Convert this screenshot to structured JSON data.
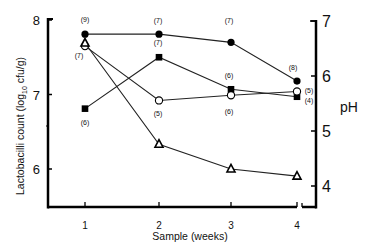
{
  "chart_data": {
    "type": "line",
    "title": "",
    "xlabel": "Sample (weeks)",
    "ylabel": "Lactobacilli count (log10 cfu/g)",
    "y2label": "pH",
    "x": [
      1,
      2,
      3,
      4
    ],
    "x_tick_labels": [
      "1",
      "2",
      "3",
      "4"
    ],
    "ylim": [
      5.5,
      8
    ],
    "y_ticks": [
      6,
      7,
      8
    ],
    "y2lim": [
      3.7,
      7
    ],
    "y2_ticks": [
      4,
      5,
      6,
      7
    ],
    "grid": false,
    "legend": "none",
    "series": [
      {
        "name": "filled-circle",
        "axis": "left",
        "marker": "filled-circle",
        "values": [
          7.81,
          7.81,
          7.7,
          7.18
        ],
        "labels": [
          "(9)",
          "(7)",
          "(7)",
          "(8)"
        ]
      },
      {
        "name": "filled-square",
        "axis": "left",
        "marker": "filled-square",
        "values": [
          6.81,
          7.5,
          7.07,
          6.97
        ],
        "labels": [
          "(6)",
          "(7)",
          "(6)",
          "(4)"
        ]
      },
      {
        "name": "open-circle",
        "axis": "left",
        "marker": "open-circle",
        "values": [
          7.65,
          6.92,
          6.99,
          7.04
        ],
        "labels": [
          "(7)",
          "(5)",
          "(6)",
          "(5)"
        ]
      },
      {
        "name": "open-triangle",
        "axis": "right",
        "marker": "open-triangle",
        "values": [
          6.6,
          4.76,
          4.31,
          4.18
        ],
        "labels": []
      }
    ]
  },
  "labels": {
    "ylabel_main": "Lactobacilli count (log",
    "ylabel_sub": "10",
    "ylabel_end": " cfu/g)",
    "y2label": "pH",
    "xlabel": "Sample (weeks)"
  }
}
